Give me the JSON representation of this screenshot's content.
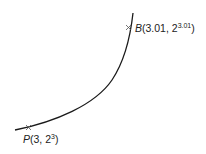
{
  "diagram": {
    "curve": {
      "description": "exponential curve y = 2^x",
      "color": "#1a1a1a"
    },
    "points": [
      {
        "name": "B",
        "x_text": "3.01",
        "base": "2",
        "exponent": "3.01"
      },
      {
        "name": "P",
        "x_text": "3",
        "base": "2",
        "exponent": "3"
      }
    ]
  }
}
